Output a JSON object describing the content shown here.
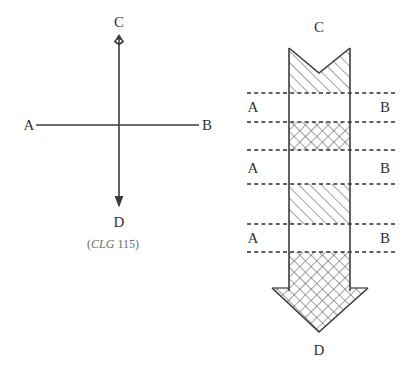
{
  "figure": {
    "caption": {
      "open_paren": "(",
      "italic_part": "CLG",
      "number_part": " 115",
      "close_paren": ")",
      "full": "(CLG 115)"
    },
    "colors": {
      "ink": "#3b3b3b",
      "dashed_line": "#2e2e2e",
      "label_text": "#333333",
      "caption_text": "#6b6b6b",
      "background": "#ffffff",
      "hatch": "#555555"
    },
    "left_diagram": {
      "name": "cross-axes-diagram",
      "description": "Vertical line from C down to D crossed by a horizontal line from A to B",
      "labels": {
        "top": "C",
        "bottom": "D",
        "left": "A",
        "right": "B"
      },
      "arrowheads": {
        "top": "barb-up",
        "bottom": "filled-triangle-down"
      },
      "geometry": {
        "vertical_x": 119,
        "vertical_top_y": 34,
        "vertical_bottom_y": 206,
        "horizontal_y": 125,
        "horizontal_left_x": 35,
        "horizontal_right_x": 199
      }
    },
    "right_diagram": {
      "name": "hatched-arrow-band-diagram",
      "description": "Vertical banded arrow from C at top to D at bottom with dashed cross lines and alternating hatch fills",
      "labels": {
        "top": "C",
        "bottom": "D",
        "left_rows": [
          "A",
          "A",
          "A"
        ],
        "right_rows": [
          "B",
          "B",
          "B"
        ]
      },
      "geometry": {
        "shaft_left_x": 289,
        "shaft_right_x": 350,
        "notch_top_y": 48,
        "notch_apex_y": 73,
        "shaft_bottom_y": 288,
        "arrow_wing_left_x": 272,
        "arrow_wing_right_x": 368,
        "arrow_tip_y": 332,
        "dash_left_x": 247,
        "dash_right_x": 397,
        "dashed_line_y": [
          93,
          122,
          150,
          184,
          224,
          252
        ]
      },
      "bands": [
        {
          "index": 0,
          "hatch": "diagonal",
          "y_top": 48,
          "y_bottom": 93,
          "label": "notch-band"
        },
        {
          "index": 1,
          "hatch": "none",
          "y_top": 93,
          "y_bottom": 122,
          "label": "clear-band-1"
        },
        {
          "index": 2,
          "hatch": "cross",
          "y_top": 122,
          "y_bottom": 150,
          "label": "cross-band-1"
        },
        {
          "index": 3,
          "hatch": "none",
          "y_top": 150,
          "y_bottom": 184,
          "label": "clear-band-2"
        },
        {
          "index": 4,
          "hatch": "diagonal",
          "y_top": 184,
          "y_bottom": 224,
          "label": "diagonal-band-2"
        },
        {
          "index": 5,
          "hatch": "none",
          "y_top": 224,
          "y_bottom": 252,
          "label": "clear-band-3"
        },
        {
          "index": 6,
          "hatch": "cross",
          "y_top": 252,
          "y_bottom": 332,
          "label": "cross-band-2-arrowhead"
        }
      ],
      "row_labels": [
        {
          "left": "A",
          "right": "B",
          "y": 112
        },
        {
          "left": "A",
          "right": "B",
          "y": 173
        },
        {
          "left": "A",
          "right": "B",
          "y": 243
        }
      ]
    }
  }
}
